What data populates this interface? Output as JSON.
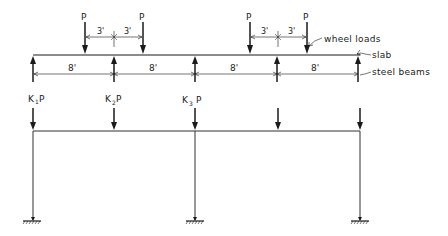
{
  "diagram": {
    "type": "structural load distribution",
    "upper_model": {
      "description": "Slab on steel beams with wheel loads",
      "wheel_loads": [
        {
          "label": "P",
          "x": 85
        },
        {
          "label": "P",
          "x": 143
        },
        {
          "label": "P",
          "x": 250
        },
        {
          "label": "P",
          "x": 307
        }
      ],
      "wheel_spacing_dims": [
        {
          "label": "3'",
          "from": 85,
          "to": 114
        },
        {
          "label": "3'",
          "from": 114,
          "to": 143
        },
        {
          "label": "3'",
          "from": 250,
          "to": 278
        },
        {
          "label": "3'",
          "from": 278,
          "to": 307
        }
      ],
      "beam_spacing_dims": [
        {
          "label": "8'",
          "from": 33,
          "to": 114
        },
        {
          "label": "8'",
          "from": 114,
          "to": 195
        },
        {
          "label": "8'",
          "from": 195,
          "to": 276
        },
        {
          "label": "8'",
          "from": 276,
          "to": 358
        }
      ],
      "annotations": {
        "wheel_loads": "wheel loads",
        "slab": "slab",
        "steel_beams": "steel beams"
      }
    },
    "lower_model": {
      "description": "Frame with equivalent beam reactions",
      "loads": [
        {
          "label_main": "K",
          "subscript": "1",
          "suffix": "P",
          "x": 33
        },
        {
          "label_main": "K",
          "subscript": "2",
          "suffix": "P",
          "x": 114
        },
        {
          "label_main": "K",
          "subscript": "3",
          "suffix": "P",
          "x": 195
        },
        {
          "label_main": "",
          "subscript": "",
          "suffix": "",
          "x": 276
        },
        {
          "label_main": "",
          "subscript": "",
          "suffix": "",
          "x": 358
        }
      ],
      "columns_x": [
        33,
        195,
        358
      ],
      "supports": "fixed"
    }
  },
  "labels": {
    "p": "P",
    "dim3": "3'",
    "dim8": "8'",
    "k": "K",
    "k1_sub": "1",
    "k2_sub": "2",
    "k3_sub": "3",
    "wheel_loads": "wheel loads",
    "slab": "slab",
    "steel_beams": "steel beams"
  }
}
